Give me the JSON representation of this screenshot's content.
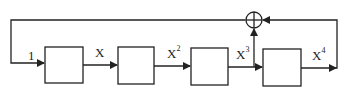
{
  "diagram": {
    "type": "linear feedback shift register",
    "stages": 4,
    "labels": {
      "input": "1",
      "tap1": "X",
      "tap2_base": "X",
      "tap2_exp": "2",
      "tap3_base": "X",
      "tap3_exp": "3",
      "tap4_base": "X",
      "tap4_exp": "4"
    },
    "nodes": [
      "register-1",
      "register-2",
      "register-3",
      "register-4",
      "xor-adder"
    ],
    "feedback": "X^3 and X^4 summed by XOR, fed back to input",
    "colors": {
      "stroke": "#222222",
      "background": "#ffffff"
    }
  }
}
